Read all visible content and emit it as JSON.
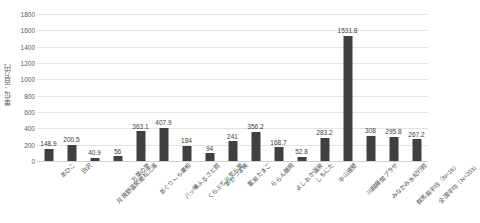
{
  "chart_data": {
    "type": "bar",
    "title": "",
    "subtitle": "",
    "xlabel": "",
    "ylabel": "単位：百万円",
    "ylim": [
      0,
      1800
    ],
    "ytick_step": 200,
    "yticks": [
      "0",
      "200",
      "400",
      "600",
      "800",
      "1000",
      "1200",
      "1400",
      "1600",
      "1800"
    ],
    "grid": true,
    "legend": "none",
    "bar_color": "#404040",
    "gridline_color": "#e2e2e2",
    "categories": [
      "あひこ",
      "白沢",
      "月夜野温泉郷松之湯",
      "万葉の里",
      "あぐり～ら東和",
      "八ッ場ふるさと館",
      "くらぶち元気ら里",
      "あがつま峡",
      "霊泉たまご",
      "ららん藤岡",
      "よしおか温泉",
      "しもにた",
      "中山道壁",
      "川越藤間プラザ",
      "みなかみ水紀行館",
      "群馬県平均（N=16）",
      "全国平均（N=203）"
    ],
    "values": [
      148.9,
      200.5,
      40.9,
      56,
      363.1,
      407.9,
      184,
      94,
      241,
      356.2,
      168.7,
      52.8,
      283.2,
      1531.8,
      308,
      295.8,
      267.2
    ],
    "value_labels": [
      "148.9",
      "200.5",
      "40.9",
      "56",
      "363.1",
      "407.9",
      "184",
      "94",
      "241",
      "356.2",
      "168.7",
      "52.8",
      "283.2",
      "1531.8",
      "308",
      "295.8",
      "267.2"
    ]
  }
}
